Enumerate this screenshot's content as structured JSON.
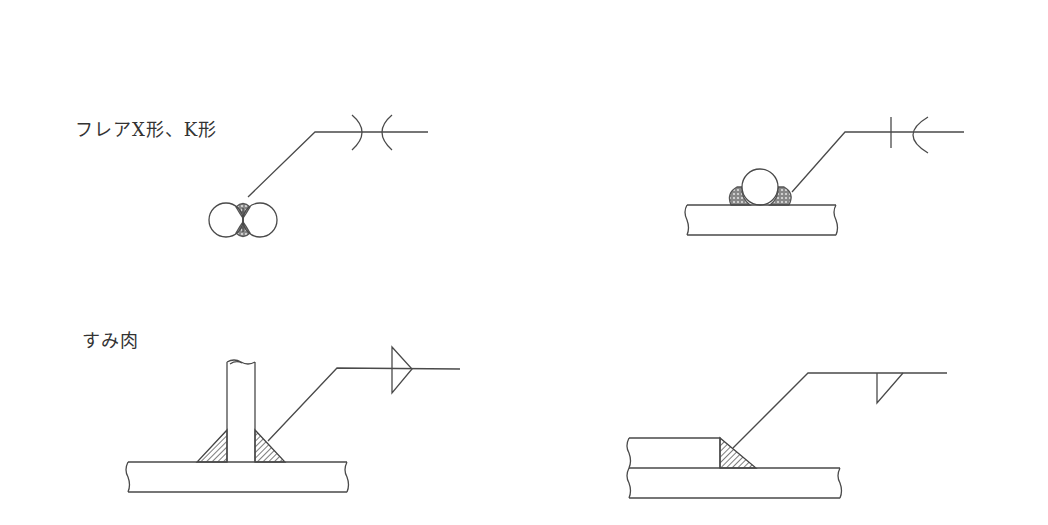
{
  "labels": {
    "flare_section": "フレアX形、K形",
    "fillet_section": "すみ肉"
  },
  "colors": {
    "line": "#4a4a4a",
    "weld_dots": "#555555",
    "hatch": "#444444",
    "background": "#ffffff"
  },
  "figures": [
    {
      "id": "flare-x",
      "description": "Flare-X weld between two round bars",
      "symbol": "double flare (X)"
    },
    {
      "id": "flare-k",
      "description": "Flare-K weld: round bar on plate",
      "symbol": "flare bevel (K)"
    },
    {
      "id": "fillet-t",
      "description": "Double fillet weld on T-joint",
      "symbol": "fillet, both sides"
    },
    {
      "id": "fillet-lap",
      "description": "Single fillet weld on lap joint",
      "symbol": "fillet, arrow side"
    }
  ]
}
